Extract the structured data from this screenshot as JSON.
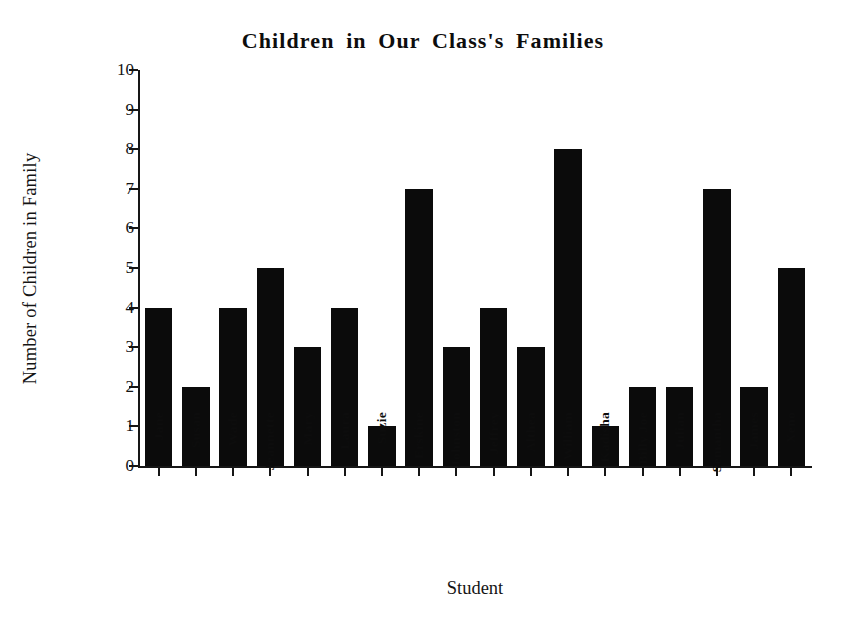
{
  "chart_data": {
    "type": "bar",
    "title": "Children in Our Class's Families",
    "xlabel": "Student",
    "ylabel": "Number of Children in Family",
    "categories": [
      "Jane",
      "Susan",
      "Wade",
      "Jeannette",
      "Mary",
      "Laura",
      "Suzie",
      "Erskine",
      "Johnston",
      "Jeffrey",
      "Althea",
      "William",
      "Kadisha",
      "Billy Joe",
      "Julian",
      "Semantha",
      "James",
      "Xeno"
    ],
    "values": [
      4,
      2,
      4,
      5,
      3,
      4,
      1,
      7,
      3,
      4,
      3,
      8,
      1,
      2,
      2,
      7,
      2,
      5
    ],
    "ylim": [
      0,
      10
    ],
    "ytick_labels": [
      "0",
      "1",
      "2",
      "3",
      "4",
      "5",
      "6",
      "7",
      "8",
      "9",
      "10"
    ],
    "ytick_values": [
      0,
      1,
      2,
      3,
      4,
      5,
      6,
      7,
      8,
      9,
      10
    ],
    "grid": false,
    "legend": false,
    "bar_color": "#0b0b0b",
    "background_color": "#ffffff",
    "axis_color": "#161616"
  }
}
